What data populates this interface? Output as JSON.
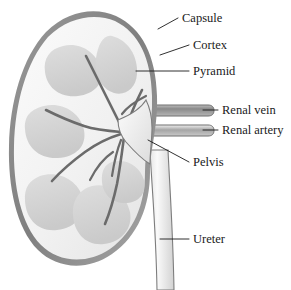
{
  "figure": {
    "background_color": "#ffffff",
    "label_color": "#1a1a1a",
    "outline_color": "#6e6e6e",
    "capsule_color": "#8c8c8c",
    "cortex_color": "#f2f2f2",
    "pyramid_color": "#d5d5d5",
    "vessel_dark_color": "#8f8f8f",
    "vessel_light_color": "#e8e8e8"
  },
  "labels": [
    {
      "id": "capsule",
      "text": "Capsule",
      "x": 182,
      "y": 22
    },
    {
      "id": "cortex",
      "text": "Cortex",
      "x": 193,
      "y": 49
    },
    {
      "id": "pyramid",
      "text": "Pyramid",
      "x": 193,
      "y": 75
    },
    {
      "id": "renal-vein",
      "text": "Renal vein",
      "x": 222,
      "y": 114
    },
    {
      "id": "renal-artery",
      "text": "Renal artery",
      "x": 222,
      "y": 134
    },
    {
      "id": "pelvis",
      "text": "Pelvis",
      "x": 193,
      "y": 166
    },
    {
      "id": "ureter",
      "text": "Ureter",
      "x": 193,
      "y": 243
    }
  ],
  "structures": [
    {
      "id": "capsule",
      "name": "Capsule",
      "description": "Outer fibrous ring enclosing the kidney"
    },
    {
      "id": "cortex",
      "name": "Cortex",
      "description": "Pale outer region beneath the capsule"
    },
    {
      "id": "pyramid",
      "name": "Pyramid",
      "description": "Medullary pyramids, rounded triangular gray regions"
    },
    {
      "id": "renal-vein",
      "name": "Renal vein",
      "description": "Upper horizontal vessel leaving the hilum"
    },
    {
      "id": "renal-artery",
      "name": "Renal artery",
      "description": "Lower horizontal vessel entering the hilum"
    },
    {
      "id": "pelvis",
      "name": "Pelvis",
      "description": "Funnel collecting region converging to the ureter"
    },
    {
      "id": "ureter",
      "name": "Ureter",
      "description": "Vertical tube descending from the pelvis"
    }
  ]
}
